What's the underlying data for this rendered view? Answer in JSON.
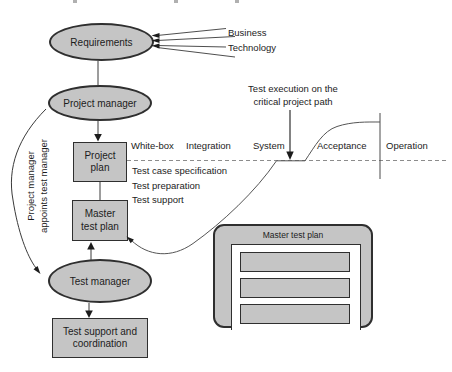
{
  "colors": {
    "shape_fill": "#c5c5c5",
    "shape_border": "#2f2f2f",
    "connector": "#3a3a3a",
    "dashed_line": "#8c8c8c",
    "text": "#1c1c1c"
  },
  "nodes": {
    "requirements": "Requirements",
    "project_manager": "Project manager",
    "project_plan": [
      "Project",
      "plan"
    ],
    "master_test_plan": [
      "Master",
      "test plan"
    ],
    "test_manager": "Test manager",
    "test_support": [
      "Test support and",
      "coordination"
    ]
  },
  "inputs": {
    "business": "Business",
    "technology": "Technology"
  },
  "appointment_note": [
    "Project manager",
    "appoints test manager"
  ],
  "timeline": {
    "phases": [
      "White-box",
      "Integration",
      "System",
      "Acceptance",
      "Operation"
    ],
    "activities": [
      "Test case specification",
      "Test preparation",
      "Test support"
    ],
    "execution_note": [
      "Test execution on the",
      "critical project path"
    ]
  },
  "master_plan_document": {
    "title": "Master test plan",
    "section_count": 3
  }
}
